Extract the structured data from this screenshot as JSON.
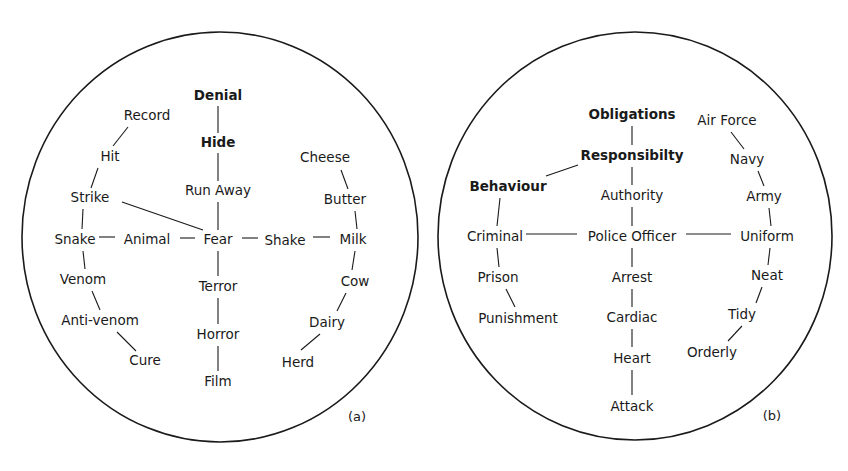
{
  "figure": {
    "panels": [
      {
        "id": "a",
        "label": "(a)",
        "label_pos": [
          357,
          417
        ],
        "circle": {
          "cx": 220,
          "cy": 237,
          "rx": 198,
          "ry": 205
        },
        "nodes": [
          {
            "id": "denial",
            "text": "Denial",
            "x": 218,
            "y": 96,
            "bold": true
          },
          {
            "id": "record",
            "text": "Record",
            "x": 147,
            "y": 116,
            "bold": false
          },
          {
            "id": "hide",
            "text": "Hide",
            "x": 218,
            "y": 143,
            "bold": true
          },
          {
            "id": "hit",
            "text": "Hit",
            "x": 110,
            "y": 157,
            "bold": false
          },
          {
            "id": "cheese",
            "text": "Cheese",
            "x": 325,
            "y": 158,
            "bold": false
          },
          {
            "id": "run-away",
            "text": "Run Away",
            "x": 218,
            "y": 191,
            "bold": false
          },
          {
            "id": "strike",
            "text": "Strike",
            "x": 90,
            "y": 198,
            "bold": false
          },
          {
            "id": "butter",
            "text": "Butter",
            "x": 345,
            "y": 200,
            "bold": false
          },
          {
            "id": "snake",
            "text": "Snake",
            "x": 75,
            "y": 240,
            "bold": false
          },
          {
            "id": "animal",
            "text": "Animal",
            "x": 147,
            "y": 240,
            "bold": false
          },
          {
            "id": "fear",
            "text": "Fear",
            "x": 218,
            "y": 240,
            "bold": false
          },
          {
            "id": "shake",
            "text": "Shake",
            "x": 285,
            "y": 241,
            "bold": false
          },
          {
            "id": "milk",
            "text": "Milk",
            "x": 353,
            "y": 240,
            "bold": false
          },
          {
            "id": "venom",
            "text": "Venom",
            "x": 83,
            "y": 280,
            "bold": false
          },
          {
            "id": "terror",
            "text": "Terror",
            "x": 218,
            "y": 287,
            "bold": false
          },
          {
            "id": "cow",
            "text": "Cow",
            "x": 355,
            "y": 282,
            "bold": false
          },
          {
            "id": "anti-venom",
            "text": "Anti-venom",
            "x": 100,
            "y": 321,
            "bold": false
          },
          {
            "id": "dairy",
            "text": "Dairy",
            "x": 327,
            "y": 323,
            "bold": false
          },
          {
            "id": "horror",
            "text": "Horror",
            "x": 218,
            "y": 335,
            "bold": false
          },
          {
            "id": "cure",
            "text": "Cure",
            "x": 145,
            "y": 361,
            "bold": false
          },
          {
            "id": "herd",
            "text": "Herd",
            "x": 298,
            "y": 363,
            "bold": false
          },
          {
            "id": "film",
            "text": "Film",
            "x": 218,
            "y": 382,
            "bold": false
          }
        ],
        "edges": [
          {
            "from": "denial",
            "to": "hide",
            "line": [
              218,
              106,
              218,
              133
            ]
          },
          {
            "from": "hide",
            "to": "run-away",
            "line": [
              218,
              153,
              218,
              181
            ]
          },
          {
            "from": "run-away",
            "to": "fear",
            "line": [
              218,
              202,
              218,
              230
            ]
          },
          {
            "from": "record",
            "to": "hit",
            "line": [
              128,
              127,
              113,
              146
            ]
          },
          {
            "from": "hit",
            "to": "strike",
            "line": [
              98,
              168,
              91,
              188
            ]
          },
          {
            "from": "strike",
            "to": "fear",
            "line": [
              122,
              202,
              203,
              230
            ]
          },
          {
            "from": "strike",
            "to": "snake",
            "line": [
              83,
              209,
              82,
              229
            ]
          },
          {
            "from": "snake",
            "to": "animal",
            "line": [
              99,
              237,
              115,
              237
            ]
          },
          {
            "from": "animal",
            "to": "fear",
            "line": [
              180,
              238,
              195,
              238
            ]
          },
          {
            "from": "fear",
            "to": "shake",
            "line": [
              242,
              238,
              258,
              238
            ]
          },
          {
            "from": "shake",
            "to": "milk",
            "line": [
              313,
              237,
              330,
              237
            ]
          },
          {
            "from": "cheese",
            "to": "butter",
            "line": [
              341,
              170,
              348,
              189
            ]
          },
          {
            "from": "butter",
            "to": "milk",
            "line": [
              355,
              211,
              357,
              229
            ]
          },
          {
            "from": "fear",
            "to": "terror",
            "line": [
              218,
              251,
              218,
              276
            ]
          },
          {
            "from": "terror",
            "to": "horror",
            "line": [
              218,
              298,
              218,
              324
            ]
          },
          {
            "from": "horror",
            "to": "film",
            "line": [
              218,
              346,
              218,
              371
            ]
          },
          {
            "from": "snake",
            "to": "venom",
            "line": [
              83,
              251,
              85,
              269
            ]
          },
          {
            "from": "venom",
            "to": "anti-venom",
            "line": [
              92,
              291,
              100,
              310
            ]
          },
          {
            "from": "anti-venom",
            "to": "cure",
            "line": [
              117,
              332,
              136,
              351
            ]
          },
          {
            "from": "milk",
            "to": "cow",
            "line": [
              355,
              251,
              352,
              270
            ]
          },
          {
            "from": "cow",
            "to": "dairy",
            "line": [
              346,
              293,
              337,
              311
            ]
          },
          {
            "from": "dairy",
            "to": "herd",
            "line": [
              320,
              334,
              301,
              350
            ]
          }
        ]
      },
      {
        "id": "b",
        "label": "(b)",
        "label_pos": [
          772,
          416
        ],
        "circle": {
          "cx": 635,
          "cy": 236,
          "rx": 197,
          "ry": 204
        },
        "nodes": [
          {
            "id": "obligations",
            "text": "Obligations",
            "x": 632,
            "y": 115,
            "bold": true
          },
          {
            "id": "air-force",
            "text": "Air Force",
            "x": 727,
            "y": 121,
            "bold": false
          },
          {
            "id": "responsibilty",
            "text": "Responsibilty",
            "x": 632,
            "y": 156,
            "bold": true
          },
          {
            "id": "navy",
            "text": "Navy",
            "x": 747,
            "y": 160,
            "bold": false
          },
          {
            "id": "behaviour",
            "text": "Behaviour",
            "x": 508,
            "y": 187,
            "bold": true
          },
          {
            "id": "authority",
            "text": "Authority",
            "x": 632,
            "y": 196,
            "bold": false
          },
          {
            "id": "army",
            "text": "Army",
            "x": 764,
            "y": 197,
            "bold": false
          },
          {
            "id": "criminal",
            "text": "Criminal",
            "x": 495,
            "y": 237,
            "bold": false
          },
          {
            "id": "police-officer",
            "text": "Police Officer",
            "x": 632,
            "y": 237,
            "bold": false
          },
          {
            "id": "uniform",
            "text": "Uniform",
            "x": 767,
            "y": 237,
            "bold": false
          },
          {
            "id": "prison",
            "text": "Prison",
            "x": 498,
            "y": 278,
            "bold": false
          },
          {
            "id": "arrest",
            "text": "Arrest",
            "x": 632,
            "y": 278,
            "bold": false
          },
          {
            "id": "neat",
            "text": "Neat",
            "x": 767,
            "y": 276,
            "bold": false
          },
          {
            "id": "punishment",
            "text": "Punishment",
            "x": 518,
            "y": 319,
            "bold": false
          },
          {
            "id": "cardiac",
            "text": "Cardiac",
            "x": 632,
            "y": 318,
            "bold": false
          },
          {
            "id": "tidy",
            "text": "Tidy",
            "x": 742,
            "y": 315,
            "bold": false
          },
          {
            "id": "orderly",
            "text": "Orderly",
            "x": 712,
            "y": 353,
            "bold": false
          },
          {
            "id": "heart",
            "text": "Heart",
            "x": 632,
            "y": 359,
            "bold": false
          },
          {
            "id": "attack",
            "text": "Attack",
            "x": 632,
            "y": 407,
            "bold": false
          }
        ],
        "edges": [
          {
            "from": "obligations",
            "to": "responsibilty",
            "line": [
              632,
              126,
              632,
              145
            ]
          },
          {
            "from": "responsibilty",
            "to": "authority",
            "line": [
              632,
              167,
              632,
              185
            ]
          },
          {
            "from": "responsibilty",
            "to": "behaviour",
            "line": [
              578,
              165,
              546,
              176
            ]
          },
          {
            "from": "authority",
            "to": "police-officer",
            "line": [
              632,
              207,
              632,
              226
            ]
          },
          {
            "from": "behaviour",
            "to": "criminal",
            "line": [
              500,
              198,
              497,
              226
            ]
          },
          {
            "from": "criminal",
            "to": "police-officer",
            "line": [
              526,
              234,
              577,
              234
            ]
          },
          {
            "from": "police-officer",
            "to": "uniform",
            "line": [
              686,
              234,
              731,
              234
            ]
          },
          {
            "from": "air-force",
            "to": "navy",
            "line": [
              731,
              132,
              744,
              149
            ]
          },
          {
            "from": "navy",
            "to": "army",
            "line": [
              758,
              171,
              764,
              186
            ]
          },
          {
            "from": "army",
            "to": "uniform",
            "line": [
              769,
              208,
              771,
              226
            ]
          },
          {
            "from": "criminal",
            "to": "prison",
            "line": [
              497,
              248,
              499,
              267
            ]
          },
          {
            "from": "prison",
            "to": "punishment",
            "line": [
              506,
              289,
              515,
              307
            ]
          },
          {
            "from": "police-officer",
            "to": "arrest",
            "line": [
              632,
              248,
              632,
              267
            ]
          },
          {
            "from": "arrest",
            "to": "cardiac",
            "line": [
              632,
              289,
              632,
              307
            ]
          },
          {
            "from": "cardiac",
            "to": "heart",
            "line": [
              632,
              329,
              632,
              347
            ]
          },
          {
            "from": "heart",
            "to": "attack",
            "line": [
              632,
              370,
              632,
              395
            ]
          },
          {
            "from": "uniform",
            "to": "neat",
            "line": [
              770,
              248,
              768,
              265
            ]
          },
          {
            "from": "neat",
            "to": "tidy",
            "line": [
              762,
              287,
              756,
              303
            ]
          },
          {
            "from": "tidy",
            "to": "orderly",
            "line": [
              742,
              326,
              728,
              341
            ]
          }
        ]
      }
    ]
  }
}
